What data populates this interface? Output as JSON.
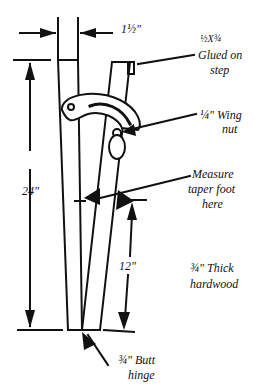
{
  "diagram": {
    "labels": {
      "width_dim": "1½\"",
      "step_size": "½X¾",
      "step_line1": "Glued on",
      "step_line2": "step",
      "wing_nut_line1": "¼\" Wing",
      "wing_nut_line2": "nut",
      "measure_line1": "Measure",
      "measure_line2": "taper foot",
      "measure_line3": "here",
      "total_height": "24\"",
      "partial_height": "12\"",
      "material_line1": "¾\" Thick",
      "material_line2": "hardwood",
      "hinge_line1": "¾\" Butt",
      "hinge_line2": "hinge"
    }
  }
}
